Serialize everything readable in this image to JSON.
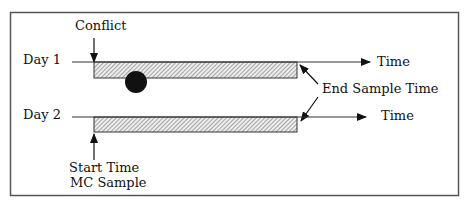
{
  "diagram": {
    "rows": [
      {
        "label": "Day 1",
        "axis_label": "Time"
      },
      {
        "label": "Day 2",
        "axis_label": "Time"
      }
    ],
    "annotations": {
      "conflict": "Conflict",
      "end_sample_time": "End Sample Time",
      "start_time_line1": "Start Time",
      "start_time_line2": "MC Sample"
    },
    "markers": [
      {
        "type": "conflict-event",
        "row": "Day 1",
        "shape": "filled-circle"
      }
    ],
    "colors": {
      "ink": "#111111",
      "frame": "#555555",
      "bar_fill": "#d0d0d0"
    }
  }
}
